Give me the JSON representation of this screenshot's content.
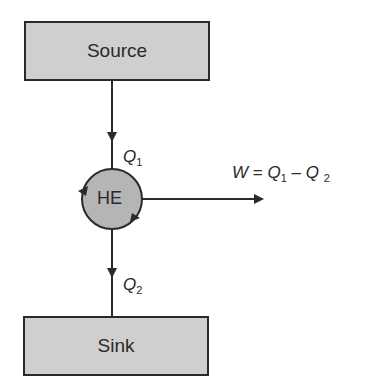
{
  "diagram": {
    "source": {
      "label": "Source"
    },
    "sink": {
      "label": "Sink"
    },
    "engine": {
      "label": "HE"
    },
    "q1": {
      "symbol": "Q",
      "sub": "1"
    },
    "q2": {
      "symbol": "Q",
      "sub": "2"
    },
    "work": {
      "lhs": "W",
      "eq": " = ",
      "q1": "Q",
      "q1_sub": "1",
      "minus": " – ",
      "q2": "Q",
      "q2_sub": "2"
    },
    "colors": {
      "box_fill": "#cfcfcf",
      "circle_fill": "#b5b5b5",
      "stroke": "#2a2a2a"
    }
  }
}
